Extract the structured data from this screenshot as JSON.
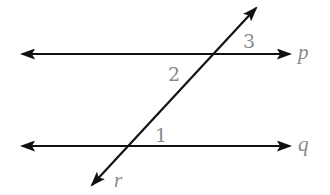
{
  "diagram": {
    "lines": [
      {
        "id": "p",
        "label": "p",
        "type": "line",
        "x1": 22,
        "y1": 54,
        "x2": 290,
        "y2": 54
      },
      {
        "id": "q",
        "label": "q",
        "type": "line",
        "x1": 22,
        "y1": 146,
        "x2": 290,
        "y2": 146
      },
      {
        "id": "r",
        "label": "r",
        "type": "transversal",
        "x1": 92,
        "y1": 185,
        "x2": 256,
        "y2": 8
      }
    ],
    "intersections": [
      {
        "lines": [
          "p",
          "r"
        ],
        "x": 212,
        "y": 54
      },
      {
        "lines": [
          "q",
          "r"
        ],
        "x": 128,
        "y": 146
      }
    ],
    "angle_labels": [
      {
        "id": "angle-1",
        "text": "1",
        "x": 155,
        "y": 142
      },
      {
        "id": "angle-2",
        "text": "2",
        "x": 168,
        "y": 81
      },
      {
        "id": "angle-3",
        "text": "3",
        "x": 243,
        "y": 48
      }
    ],
    "line_labels": {
      "p": {
        "text": "p",
        "x": 298,
        "y": 59
      },
      "q": {
        "text": "q",
        "x": 298,
        "y": 151
      },
      "r": {
        "text": "r",
        "x": 114,
        "y": 187
      }
    },
    "colors": {
      "line": "#111111",
      "label": "#8a8a8a",
      "background": "#ffffff"
    }
  }
}
